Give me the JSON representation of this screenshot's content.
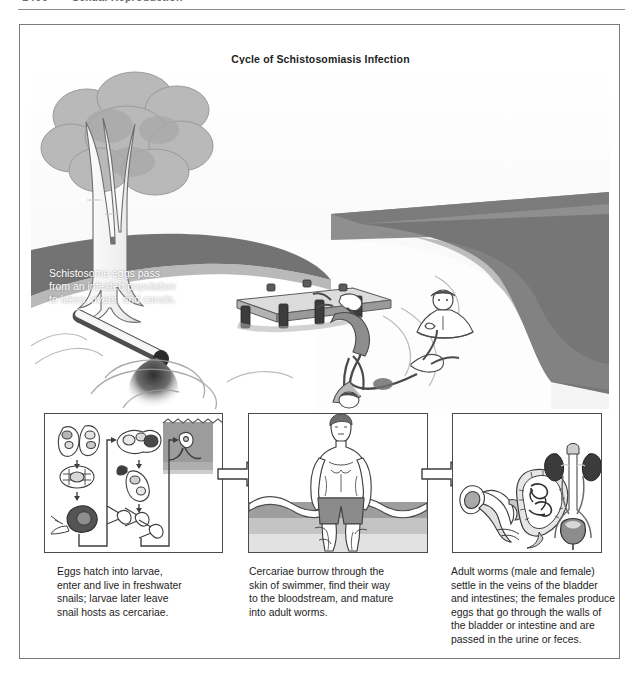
{
  "running_head": {
    "folio": "1406",
    "title": "Sexual Reproduction"
  },
  "figure": {
    "title": "Cycle of Schistosomiasis Infection",
    "scene_caption": "Schistosome eggs pass\nfrom an infested population\nto lakes, rivers, and canals.",
    "scene_elements": {
      "tree": "tree-illustration",
      "lake": "lake-water",
      "bank": "grassy-bank",
      "dock": "wooden-dock",
      "diver": "diving-swimmer",
      "wader": "standing-swimmer",
      "floater": "floating-swimmer",
      "pipe": "sewage-outflow-pipe",
      "effluent": "dark-effluent-plume"
    }
  },
  "panels": [
    {
      "id": "panel-1",
      "name": "snail-larval-stage-panel",
      "alt": "Schistosome eggs, miracidium, snail host, sporocysts and cercariae flow diagram",
      "caption": "Eggs hatch into larvae,\nenter and live in freshwater\nsnails; larvae later leave\nsnail hosts as cercariae."
    },
    {
      "id": "panel-2",
      "name": "human-infection-panel",
      "alt": "Man standing waist deep in water with cercariae penetrating skin",
      "caption": "Cercariae burrow through the\nskin of swimmer, find their way\nto the bloodstream, and mature\ninto adult worms."
    },
    {
      "id": "panel-3",
      "name": "adult-worm-organs-panel",
      "alt": "Adult worm pair, intestines, kidneys and bladder",
      "caption": "Adult worms (male and female)\nsettle in the veins of the bladder\nand intestines; the females produce\neggs that go through the walls of\nthe bladder or intestine and are\npassed in the urine or feces."
    }
  ],
  "arrows": [
    {
      "name": "arrow-panel1-to-panel2",
      "direction": "right"
    },
    {
      "name": "arrow-panel2-to-panel3",
      "direction": "right"
    }
  ],
  "colors": {
    "frame_border": "#7b7b7b",
    "panel_border": "#4a4a4a",
    "text": "#1d1d1d",
    "caption_text": "#ffffff",
    "water_light": "#fdfdfd",
    "bank_dark": "#6f6f6f",
    "bank_mid": "#8f8f8f",
    "foliage": "#b6b6b6",
    "trunk": "#f2f2f2",
    "dock": "#d8d8d8",
    "effluent": "#3a3a3a",
    "skin": "#ffffff",
    "trunks_shorts": "#8c8c8c",
    "organ_dark": "#4f4f4f"
  }
}
